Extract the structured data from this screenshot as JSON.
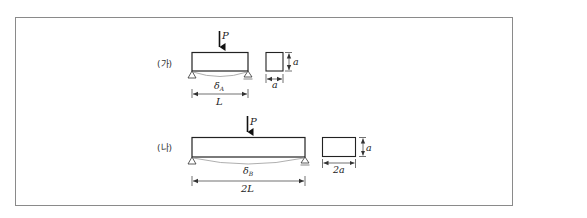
{
  "figure": {
    "panels": [
      {
        "id": "ga",
        "label": "(가)",
        "load": "P",
        "deflection": "δ",
        "deflection_sub": "A",
        "span": "L",
        "section_height": "a",
        "section_width": "a"
      },
      {
        "id": "na",
        "label": "(나)",
        "load": "P",
        "deflection": "δ",
        "deflection_sub": "B",
        "span": "2L",
        "section_height": "a",
        "section_width": "2a"
      }
    ]
  }
}
